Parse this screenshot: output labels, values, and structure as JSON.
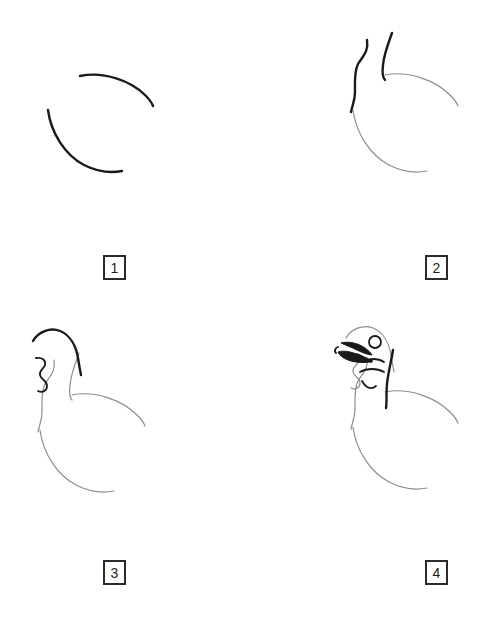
{
  "sheet": {
    "kind": "step-by-step-drawing-tutorial",
    "subject": "turkey",
    "background_color": "#ffffff",
    "previous_stroke_color": "#8e8e8e",
    "new_stroke_color": "#1a1a1a",
    "badge_border_color": "#2b2b2b",
    "columns": 2,
    "rows": 2
  },
  "panels": [
    {
      "number": "1",
      "label": "1",
      "description": "Two separate curved arcs forming the start of the body mass",
      "new_strokes": 2,
      "previous_strokes": 0
    },
    {
      "number": "2",
      "label": "2",
      "description": "Two dark neck lines added above the gray body curves from step 1",
      "new_strokes": 2,
      "previous_strokes": 2
    },
    {
      "number": "3",
      "label": "3",
      "description": "Dark head crown curve and zigzag wattle added to the gray neck and body",
      "new_strokes": 2,
      "previous_strokes": 4
    },
    {
      "number": "4",
      "label": "4",
      "description": "Beak, round eye, facial markings and dark nape stripe complete the head",
      "new_strokes": 6,
      "previous_strokes": 6
    }
  ]
}
